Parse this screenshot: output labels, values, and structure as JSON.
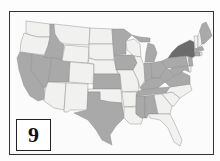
{
  "figure": {
    "label": "9",
    "colors": {
      "light": "#f1f1ef",
      "medium": "#a9a9a9",
      "dark": "#6b6b6b",
      "border": "#8a8a8a",
      "frame": "#333333"
    }
  },
  "map": {
    "title": "",
    "legend": [],
    "categories": {
      "dark": [
        "NY"
      ],
      "medium": [
        "ID",
        "NV",
        "CA",
        "UT",
        "KS",
        "TX",
        "MN",
        "IA",
        "MI",
        "IN",
        "OH",
        "KY",
        "TN",
        "MS",
        "AL",
        "PA",
        "WV",
        "VA",
        "ME",
        "MA",
        "CT",
        "NJ",
        "MD"
      ],
      "light": [
        "WA",
        "OR",
        "MT",
        "WY",
        "CO",
        "AZ",
        "NM",
        "ND",
        "SD",
        "NE",
        "OK",
        "MO",
        "AR",
        "LA",
        "WI",
        "IL",
        "GA",
        "FL",
        "SC",
        "NC",
        "VT",
        "NH",
        "RI",
        "DE"
      ]
    }
  }
}
